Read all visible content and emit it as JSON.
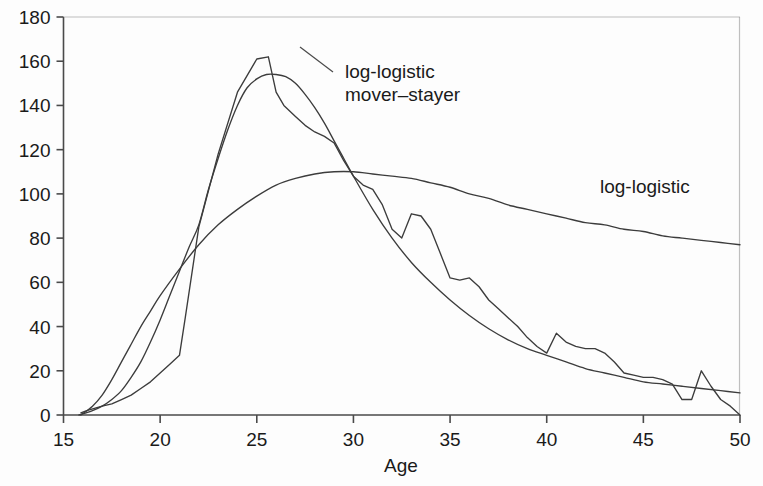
{
  "chart_data": {
    "type": "line",
    "title": "",
    "xlabel": "Age",
    "ylabel": "",
    "xlim": [
      15,
      50
    ],
    "ylim": [
      0,
      180
    ],
    "xticks": [
      15,
      20,
      25,
      30,
      35,
      40,
      45,
      50
    ],
    "yticks": [
      0,
      20,
      40,
      60,
      80,
      100,
      120,
      140,
      160,
      180
    ],
    "grid": false,
    "legend_position": "inline-annotations",
    "annotations": [
      {
        "text_line1": "log-logistic",
        "text_line2": "mover–stayer",
        "x_px": 345,
        "y_px": 66,
        "target_series": "log-logistic mover-stayer"
      },
      {
        "text_line1": "log-logistic",
        "text_line2": "",
        "x_px": 600,
        "y_px": 186,
        "target_series": "log-logistic"
      }
    ],
    "series": [
      {
        "name": "empirical",
        "style": "jagged piecewise-linear observed rates",
        "x": [
          15.9,
          16.2,
          16.6,
          17.0,
          17.5,
          18.0,
          18.5,
          19.0,
          19.5,
          20.0,
          20.5,
          21.0,
          21.3,
          22.0,
          23.0,
          24.0,
          25.0,
          25.6,
          26.0,
          26.4,
          27.0,
          27.5,
          28.0,
          28.5,
          29.0,
          29.5,
          30.0,
          30.5,
          31.0,
          31.5,
          32.0,
          32.5,
          33.0,
          33.5,
          34.0,
          34.5,
          35.0,
          35.5,
          36.0,
          36.5,
          37.0,
          37.5,
          38.0,
          38.5,
          39.0,
          39.5,
          40.0,
          40.5,
          41.0,
          41.5,
          42.0,
          42.5,
          43.0,
          43.5,
          44.0,
          44.5,
          45.0,
          45.5,
          46.0,
          46.5,
          47.0,
          47.5,
          48.0,
          48.5,
          49.0,
          49.5,
          50.0
        ],
        "y": [
          1,
          2,
          3,
          4,
          5,
          7,
          9,
          12,
          15,
          19,
          23,
          27,
          44,
          85,
          118,
          146,
          161,
          162,
          146,
          140,
          135,
          131,
          128,
          126,
          123,
          115,
          108,
          104,
          102,
          95,
          84,
          80,
          91,
          90,
          84,
          73,
          62,
          61,
          62,
          58,
          52,
          48,
          44,
          40,
          35,
          31,
          28,
          37,
          33,
          31,
          30,
          30,
          28,
          24,
          19,
          18,
          17,
          17,
          16,
          14,
          7,
          7,
          20,
          13,
          7,
          4,
          0
        ]
      },
      {
        "name": "log-logistic mover-stayer",
        "style": "smooth fitted curve, peaks near age 26",
        "x": [
          15.8,
          16.5,
          17.0,
          17.5,
          18.0,
          18.5,
          19.0,
          19.5,
          20.0,
          20.5,
          21.0,
          21.5,
          22.0,
          22.5,
          23.0,
          23.5,
          24.0,
          24.5,
          25.0,
          25.5,
          26.0,
          26.5,
          27.0,
          27.5,
          28.0,
          28.5,
          29.0,
          29.5,
          30.0,
          31.0,
          32.0,
          33.0,
          34.0,
          35.0,
          36.0,
          37.0,
          38.0,
          39.0,
          40.0,
          41.0,
          42.0,
          43.0,
          44.0,
          45.0,
          46.0,
          47.0,
          48.0,
          49.0,
          50.0
        ],
        "y": [
          0,
          2,
          4,
          7,
          11,
          17,
          24,
          33,
          43,
          54,
          65,
          76,
          86,
          102,
          116,
          129,
          140,
          148,
          152,
          154,
          154,
          153,
          150,
          145,
          139,
          132,
          124,
          116,
          108,
          93,
          80,
          69,
          60,
          52,
          45,
          39,
          34,
          30,
          27,
          24,
          21,
          19,
          17,
          15,
          14,
          13,
          12,
          11,
          10
        ]
      },
      {
        "name": "log-logistic",
        "style": "smooth flat fitted curve, peaks near 110 at age 29",
        "x": [
          15.9,
          16.5,
          17.0,
          17.5,
          18.0,
          18.5,
          19.0,
          19.5,
          20.0,
          21.0,
          22.0,
          23.0,
          24.0,
          25.0,
          26.0,
          27.0,
          28.0,
          29.0,
          30.0,
          31.0,
          32.0,
          33.0,
          34.0,
          35.0,
          36.0,
          37.0,
          38.0,
          39.0,
          40.0,
          41.0,
          42.0,
          43.0,
          44.0,
          45.0,
          46.0,
          47.0,
          48.0,
          49.0,
          50.0
        ],
        "y": [
          0,
          4,
          9,
          16,
          24,
          32,
          40,
          47,
          54,
          66,
          77,
          86,
          93,
          99,
          104,
          107,
          109,
          110,
          110,
          109,
          108,
          107,
          105,
          103,
          100,
          98,
          95,
          93,
          91,
          89,
          87,
          86,
          84,
          83,
          81,
          80,
          79,
          78,
          77
        ]
      }
    ]
  },
  "axes": {
    "x_axis_title": "Age",
    "x_tick_labels": [
      "15",
      "20",
      "25",
      "30",
      "35",
      "40",
      "45",
      "50"
    ],
    "y_tick_labels": [
      "0",
      "20",
      "40",
      "60",
      "80",
      "100",
      "120",
      "140",
      "160",
      "180"
    ]
  },
  "colors": {
    "background": "#fdfdfd",
    "axis": "#4a4a4a",
    "curve": "#3c3c3c",
    "text": "#1a1a1a"
  }
}
